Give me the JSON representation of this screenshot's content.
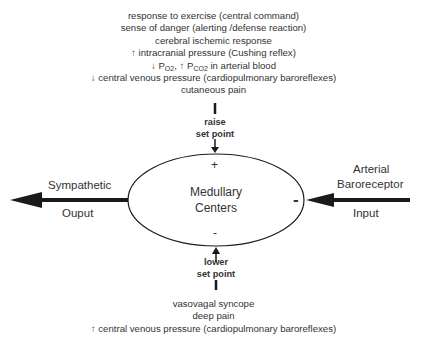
{
  "diagram": {
    "title": "",
    "center": {
      "line1": "Medullary",
      "line2": "Centers",
      "plus_sign": "+",
      "minus_bottom_sign": "-",
      "minus_right_sign": "-"
    },
    "top_influences": {
      "items": [
        {
          "prefix": "",
          "text": "response to exercise (central command)"
        },
        {
          "prefix": "",
          "text": "sense of danger (alerting /defense reaction)"
        },
        {
          "prefix": "",
          "text": "cerebral ischemic response"
        },
        {
          "prefix": "↑",
          "text": " intracranial pressure (Cushing reflex)"
        },
        {
          "prefix": "↓",
          "text": "P_O2, ↑ P_CO2 in arterial blood"
        },
        {
          "prefix": "↓",
          "text": " central venous pressure (cardiopulmonary baroreflexes)"
        },
        {
          "prefix": "",
          "text": "cutaneous pain"
        }
      ],
      "gas_line": {
        "down_arrow": "↓",
        "po": "P",
        "po_sub": "O2",
        "sep": ", ",
        "up_arrow": "↑",
        "pco": " P",
        "pco_sub": "CO2",
        "rest": " in arterial blood"
      },
      "setpoint_label_line1": "raise",
      "setpoint_label_line2": "set point"
    },
    "bottom_influences": {
      "items": [
        {
          "prefix": "",
          "text": "vasovagal syncope"
        },
        {
          "prefix": "",
          "text": "deep pain"
        },
        {
          "prefix": "↑",
          "text": " central venous pressure (cardiopulmonary baroreflexes)"
        }
      ],
      "setpoint_label_line1": "lower",
      "setpoint_label_line2": "set point"
    },
    "left_output": {
      "line1": "Sympathetic",
      "line2": "Ouput"
    },
    "right_input": {
      "line1": "Arterial",
      "line2": "Baroreceptor",
      "line3": "Input"
    },
    "colors": {
      "stroke": "#1a1a1a",
      "text": "#333333",
      "background": "#ffffff"
    }
  }
}
